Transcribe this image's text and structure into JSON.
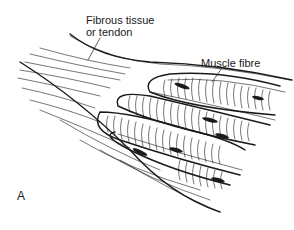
{
  "figure": {
    "panel_label": "A",
    "labels": {
      "tendon_line1": "Fibrous tissue",
      "tendon_line2": "or tendon",
      "muscle": "Muscle fibre"
    },
    "colors": {
      "ink": "#1a1a1a",
      "background": "#ffffff"
    }
  }
}
